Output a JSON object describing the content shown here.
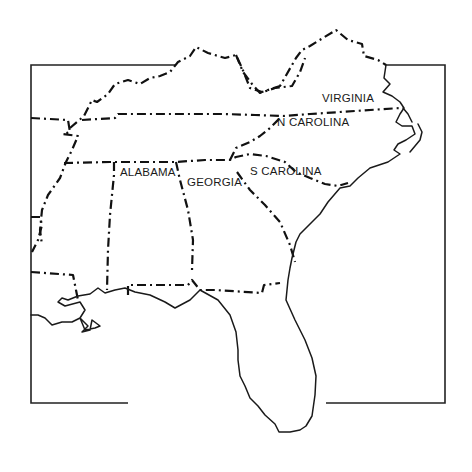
{
  "map": {
    "title": "Southeastern United States",
    "colors": {
      "background": "#ffffff",
      "ink": "#1a1a1a"
    },
    "labels": [
      {
        "id": "virginia",
        "text": "VIRGINIA",
        "x": 322,
        "y": 92
      },
      {
        "id": "n-carolina",
        "text": "N CAROLINA",
        "x": 277,
        "y": 116
      },
      {
        "id": "alabama",
        "text": "ALABAMA",
        "x": 120,
        "y": 166
      },
      {
        "id": "georgia",
        "text": "GEORGIA",
        "x": 187,
        "y": 176
      },
      {
        "id": "s-carolina",
        "text": "S CAROLINA",
        "x": 250,
        "y": 165
      }
    ],
    "legend": {
      "border_style": "dash-dot",
      "coastline_style": "solid"
    }
  }
}
